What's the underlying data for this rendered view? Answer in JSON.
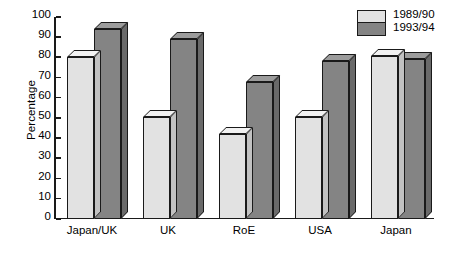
{
  "chart_data": {
    "type": "bar",
    "title": "",
    "subtitle": "",
    "xlabel": "",
    "ylabel": "Percentage",
    "ylim": [
      0,
      100
    ],
    "ytick_labels": [
      "100",
      "90",
      "80",
      "70",
      "60",
      "50",
      "40",
      "30",
      "20",
      "10",
      "0"
    ],
    "ytick_values": [
      100,
      90,
      80,
      70,
      60,
      50,
      40,
      30,
      20,
      10,
      0
    ],
    "grid": false,
    "legend_position": "top-right",
    "categories": [
      "Japan/UK",
      "UK",
      "RoE",
      "USA",
      "Japan"
    ],
    "series": [
      {
        "name": "1989/90",
        "color": "#e2e2e2",
        "values": [
          80,
          50.5,
          42,
          50.5,
          80.5
        ]
      },
      {
        "name": "1993/94",
        "color": "#848484",
        "values": [
          94,
          89,
          68,
          78,
          79
        ]
      }
    ]
  },
  "legend": {
    "entries": [
      {
        "label": "1989/90"
      },
      {
        "label": "1993/94"
      }
    ]
  },
  "axes": {
    "y_title": "Percentage"
  }
}
